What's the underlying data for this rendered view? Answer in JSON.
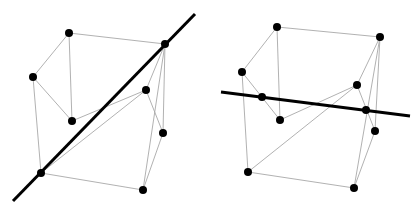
{
  "figure": {
    "background_color": "#ffffff",
    "edge_color": "#a8a8a8",
    "line_color": "#000000",
    "vertex_color": "#000000",
    "edge_width": 0.9,
    "line_width": 3.0,
    "vertex_radius": 4.0,
    "width": 418,
    "height": 224
  },
  "chart_data": {
    "type": "scatter",
    "xlabel": "",
    "ylabel": "",
    "xlim": [
      0,
      418
    ],
    "ylim": [
      0,
      224
    ],
    "grid": false,
    "legend": "none",
    "panels": [
      {
        "name": "left-cube-space-diagonal",
        "caption": "",
        "vertices": [
          {
            "id": "back-top-left",
            "x": 33,
            "y": 77
          },
          {
            "id": "back-top-right",
            "x": 69,
            "y": 33
          },
          {
            "id": "front-top-left",
            "x": 72,
            "y": 121
          },
          {
            "id": "front-top-right",
            "x": 146,
            "y": 90
          },
          {
            "id": "far-top-right",
            "x": 165,
            "y": 44
          },
          {
            "id": "mid-right",
            "x": 163,
            "y": 133
          },
          {
            "id": "bottom-left",
            "x": 41,
            "y": 173
          },
          {
            "id": "bottom-front",
            "x": 143,
            "y": 190
          }
        ],
        "edges": [
          [
            "back-top-left",
            "back-top-right"
          ],
          [
            "back-top-right",
            "far-top-right"
          ],
          [
            "back-top-left",
            "front-top-left"
          ],
          [
            "front-top-left",
            "front-top-right"
          ],
          [
            "front-top-right",
            "far-top-right"
          ],
          [
            "back-top-right",
            "front-top-left"
          ],
          [
            "front-top-right",
            "mid-right"
          ],
          [
            "far-top-right",
            "mid-right"
          ],
          [
            "back-top-left",
            "bottom-left"
          ],
          [
            "bottom-left",
            "bottom-front"
          ],
          [
            "bottom-front",
            "mid-right"
          ],
          [
            "bottom-left",
            "front-top-right"
          ],
          [
            "bottom-front",
            "far-top-right"
          ],
          [
            "bottom-left",
            "far-top-right"
          ]
        ],
        "line": {
          "id": "space-diagonal",
          "x1": 13,
          "y1": 201,
          "x2": 195,
          "y2": 14,
          "passes_through": [
            "bottom-left",
            "far-top-right"
          ]
        }
      },
      {
        "name": "right-cube-horizontal-line",
        "caption": "",
        "vertices": [
          {
            "id": "back-top-left",
            "x": 242,
            "y": 72
          },
          {
            "id": "back-top-right",
            "x": 277,
            "y": 27
          },
          {
            "id": "front-top-left",
            "x": 280,
            "y": 120
          },
          {
            "id": "front-top-right",
            "x": 357,
            "y": 85
          },
          {
            "id": "far-top-right",
            "x": 380,
            "y": 37
          },
          {
            "id": "mid-right",
            "x": 375,
            "y": 131
          },
          {
            "id": "bottom-left",
            "x": 248,
            "y": 172
          },
          {
            "id": "bottom-front",
            "x": 354,
            "y": 188
          },
          {
            "id": "edge-left-mid",
            "x": 262,
            "y": 97
          },
          {
            "id": "edge-right-mid",
            "x": 366,
            "y": 110
          }
        ],
        "edges": [
          [
            "back-top-left",
            "back-top-right"
          ],
          [
            "back-top-right",
            "far-top-right"
          ],
          [
            "back-top-left",
            "front-top-left"
          ],
          [
            "front-top-left",
            "front-top-right"
          ],
          [
            "front-top-right",
            "far-top-right"
          ],
          [
            "back-top-right",
            "front-top-left"
          ],
          [
            "front-top-right",
            "mid-right"
          ],
          [
            "far-top-right",
            "mid-right"
          ],
          [
            "back-top-left",
            "bottom-left"
          ],
          [
            "bottom-left",
            "bottom-front"
          ],
          [
            "bottom-front",
            "mid-right"
          ],
          [
            "bottom-left",
            "front-top-right"
          ],
          [
            "bottom-front",
            "far-top-right"
          ]
        ],
        "line": {
          "id": "horizontal-secant",
          "x1": 221,
          "y1": 92,
          "x2": 410,
          "y2": 116,
          "passes_through": [
            "edge-left-mid",
            "edge-right-mid"
          ]
        }
      }
    ]
  }
}
